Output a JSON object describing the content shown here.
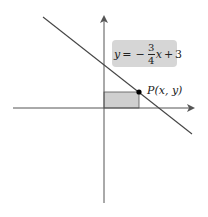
{
  "diagram": {
    "type": "coordinate-plane",
    "equation": {
      "lhs": "y",
      "equals": "=",
      "sign": "−",
      "numerator": "3",
      "denominator": "4",
      "variable": "x",
      "plus": "+",
      "constant": "3",
      "full_text": "y = −(3/4)x + 3"
    },
    "point_label": {
      "name": "P",
      "coords": "(x, y)"
    },
    "colors": {
      "axis": "#555555",
      "line": "#444444",
      "rect_fill": "#cfcfcf",
      "label_box": "#d6d6d6",
      "point": "#000000"
    }
  }
}
